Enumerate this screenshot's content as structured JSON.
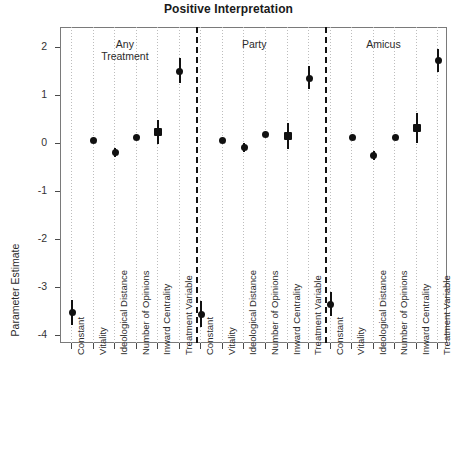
{
  "chart_data": {
    "type": "scatter",
    "title": "Positive Interpretation",
    "xlabel": "",
    "ylabel": "Parameter Estimate",
    "ylim": [
      -4.35,
      2.3
    ],
    "yticks": [
      2,
      1,
      0,
      -1,
      -2,
      -3,
      -4
    ],
    "ytick_labels": [
      "2",
      "1",
      "0",
      "-1",
      "-2",
      "-3",
      "-4"
    ],
    "grid": "vertical-dotted",
    "legend": "none",
    "group_labels": [
      "Any\nTreatment",
      "Party",
      "Amicus"
    ],
    "groups": [
      {
        "name": "Any Treatment",
        "label_line1": "Any",
        "label_line2": "Treatment",
        "points": [
          {
            "x": "Constant",
            "value": -3.54,
            "low": -3.8,
            "high": -3.28,
            "marker": "circle"
          },
          {
            "x": "Vitality",
            "value": 0.05,
            "low": 0.01,
            "high": 0.09,
            "marker": "circle"
          },
          {
            "x": "Ideological Distance",
            "value": -0.2,
            "low": -0.3,
            "high": -0.1,
            "marker": "circle"
          },
          {
            "x": "Number of Opinions",
            "value": 0.12,
            "low": 0.08,
            "high": 0.16,
            "marker": "circle"
          },
          {
            "x": "Inward Centrality",
            "value": 0.22,
            "low": -0.02,
            "high": 0.47,
            "marker": "square"
          },
          {
            "x": "Treatment Variable",
            "value": 1.5,
            "low": 1.26,
            "high": 1.78,
            "marker": "circle"
          }
        ]
      },
      {
        "name": "Party",
        "label_line1": "Party",
        "label_line2": "",
        "points": [
          {
            "x": "Constant",
            "value": -3.58,
            "low": -3.85,
            "high": -3.3,
            "marker": "circle"
          },
          {
            "x": "Vitality",
            "value": 0.05,
            "low": 0.01,
            "high": 0.09,
            "marker": "circle"
          },
          {
            "x": "Ideological Distance",
            "value": -0.09,
            "low": -0.18,
            "high": 0.0,
            "marker": "circle"
          },
          {
            "x": "Number of Opinions",
            "value": 0.17,
            "low": 0.13,
            "high": 0.21,
            "marker": "circle"
          },
          {
            "x": "Inward Centrality",
            "value": 0.15,
            "low": -0.12,
            "high": 0.42,
            "marker": "square"
          },
          {
            "x": "Treatment Variable",
            "value": 1.35,
            "low": 1.12,
            "high": 1.6,
            "marker": "circle"
          }
        ]
      },
      {
        "name": "Amicus",
        "label_line1": "Amicus",
        "label_line2": "",
        "points": [
          {
            "x": "Constant",
            "value": -3.37,
            "low": -3.62,
            "high": -3.11,
            "marker": "circle"
          },
          {
            "x": "Vitality",
            "value": 0.11,
            "low": 0.07,
            "high": 0.15,
            "marker": "circle"
          },
          {
            "x": "Ideological Distance",
            "value": -0.26,
            "low": -0.36,
            "high": -0.16,
            "marker": "circle"
          },
          {
            "x": "Number of Opinions",
            "value": 0.12,
            "low": 0.08,
            "high": 0.16,
            "marker": "circle"
          },
          {
            "x": "Inward Centrality",
            "value": 0.32,
            "low": 0.01,
            "high": 0.63,
            "marker": "square"
          },
          {
            "x": "Treatment Variable",
            "value": 1.72,
            "low": 1.48,
            "high": 1.96,
            "marker": "circle"
          }
        ]
      }
    ],
    "xtick_labels": [
      "Constant",
      "Vitality",
      "Ideological Distance",
      "Number of Opinions",
      "Inward Centrality",
      "Treatment Variable",
      "Constant",
      "Vitality",
      "Ideological Distance",
      "Number of Opinions",
      "Inward Centrality",
      "Treatment Variable",
      "Constant",
      "Vitality",
      "Ideological Distance",
      "Number of Opinions",
      "Inward Centrality",
      "Treatment Variable"
    ],
    "dividers_after_index": [
      5,
      11
    ],
    "colors": {
      "marker": "#111111",
      "axis": "#7a7a7a",
      "grid": "#bdbdbd",
      "divider": "#111111"
    }
  }
}
